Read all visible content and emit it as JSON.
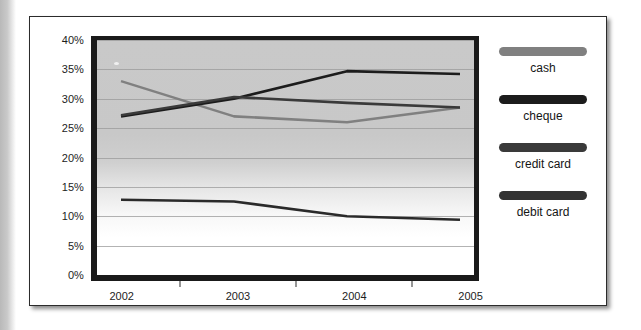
{
  "chart_data": {
    "type": "line",
    "title": "",
    "xlabel": "",
    "ylabel": "",
    "categories": [
      "2002",
      "2003",
      "2004",
      "2005"
    ],
    "ylim": [
      0,
      40
    ],
    "yticks": [
      "0%",
      "5%",
      "10%",
      "15%",
      "20%",
      "25%",
      "30%",
      "35%",
      "40%"
    ],
    "ytick_values": [
      0,
      5,
      10,
      15,
      20,
      25,
      30,
      35,
      40
    ],
    "grid": true,
    "legend_position": "right",
    "series": [
      {
        "name": "cash",
        "color": "#808080",
        "values": [
          33.0,
          27.0,
          26.0,
          28.5
        ]
      },
      {
        "name": "cheque",
        "color": "#1c1c1c",
        "values": [
          27.0,
          30.0,
          34.7,
          34.2
        ]
      },
      {
        "name": "credit card",
        "color": "#3a3a3a",
        "values": [
          27.2,
          30.3,
          29.3,
          28.5
        ]
      },
      {
        "name": "debit card",
        "color": "#2a2a2a",
        "values": [
          12.8,
          12.5,
          10.0,
          9.4
        ]
      }
    ]
  },
  "legend": {
    "items": [
      {
        "label": "cash",
        "color": "#808080"
      },
      {
        "label": "cheque",
        "color": "#1c1c1c"
      },
      {
        "label": "credit card",
        "color": "#3a3a3a"
      },
      {
        "label": "debit card",
        "color": "#333333"
      }
    ]
  },
  "axes": {
    "y": {
      "ticks": [
        "40%",
        "35%",
        "30%",
        "25%",
        "20%",
        "15%",
        "10%",
        "5%",
        "0%"
      ]
    },
    "x": {
      "ticks": [
        "2002",
        "2003",
        "2004",
        "2005"
      ]
    }
  }
}
